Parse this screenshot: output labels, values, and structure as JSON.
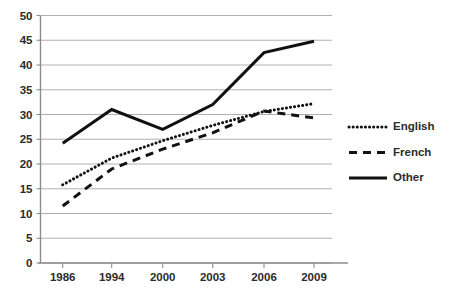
{
  "chart_data": {
    "type": "line",
    "title": "",
    "subtitle": "",
    "xlabel": "",
    "ylabel": "",
    "categories": [
      "1986",
      "1994",
      "2000",
      "2003",
      "2006",
      "2009"
    ],
    "x": [
      1986,
      1994,
      2000,
      2003,
      2006,
      2009
    ],
    "xlim": [
      1986,
      2009
    ],
    "ylim": [
      0,
      50
    ],
    "yticks": [
      0,
      5,
      10,
      15,
      20,
      25,
      30,
      35,
      40,
      45,
      50
    ],
    "ytick_labels": [
      "0",
      "5",
      "10",
      "15",
      "20",
      "25",
      "30",
      "35",
      "40",
      "45",
      "50"
    ],
    "xtick_labels": [
      "1986",
      "1994",
      "2000",
      "2003",
      "2006",
      "2009"
    ],
    "grid": true,
    "grid_axis": "y",
    "legend_position": "right",
    "series": [
      {
        "name": "English",
        "style": "dotted",
        "color": "#111111",
        "values": [
          15.8,
          21.2,
          24.7,
          27.8,
          30.6,
          32.2
        ]
      },
      {
        "name": "French",
        "style": "dashed",
        "color": "#111111",
        "values": [
          11.5,
          19.0,
          23.0,
          26.3,
          30.7,
          29.3
        ]
      },
      {
        "name": "Other",
        "style": "solid",
        "color": "#111111",
        "values": [
          24.2,
          31.0,
          27.0,
          32.0,
          42.5,
          44.8
        ]
      }
    ]
  },
  "legend": {
    "items": [
      {
        "label": "English",
        "style": "dotted"
      },
      {
        "label": "French",
        "style": "dashed"
      },
      {
        "label": "Other",
        "style": "solid"
      }
    ]
  },
  "colors": {
    "ink": "#111111",
    "grid": "#a8a8a8",
    "axis": "#8c8c8c",
    "background": "#ffffff"
  }
}
